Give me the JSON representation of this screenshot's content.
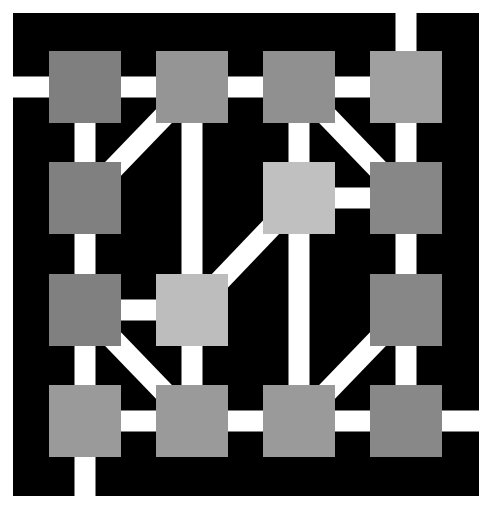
{
  "diagram": {
    "type": "grid-graph",
    "canvas": {
      "width": 490,
      "height": 509,
      "background": "#ffffff"
    },
    "board": {
      "x": 13,
      "y": 13,
      "width": 466,
      "height": 483,
      "color": "#000000"
    },
    "edge_color": "#ffffff",
    "edge_width": 21,
    "node_size": 72,
    "columns_x": [
      85,
      192,
      299,
      406
    ],
    "rows_y": [
      87,
      198,
      310,
      421
    ],
    "nodes": [
      {
        "id": "r0c0",
        "row": 0,
        "col": 0,
        "color": "#7f7f7f"
      },
      {
        "id": "r0c1",
        "row": 0,
        "col": 1,
        "color": "#959595"
      },
      {
        "id": "r0c2",
        "row": 0,
        "col": 2,
        "color": "#909090"
      },
      {
        "id": "r0c3",
        "row": 0,
        "col": 3,
        "color": "#a0a0a0"
      },
      {
        "id": "r1c0",
        "row": 1,
        "col": 0,
        "color": "#808080"
      },
      {
        "id": "r1c2",
        "row": 1,
        "col": 2,
        "color": "#c0c0c0"
      },
      {
        "id": "r1c3",
        "row": 1,
        "col": 3,
        "color": "#878787"
      },
      {
        "id": "r2c0",
        "row": 2,
        "col": 0,
        "color": "#808080"
      },
      {
        "id": "r2c1",
        "row": 2,
        "col": 1,
        "color": "#bdbdbd"
      },
      {
        "id": "r2c3",
        "row": 2,
        "col": 3,
        "color": "#878787"
      },
      {
        "id": "r3c0",
        "row": 3,
        "col": 0,
        "color": "#9a9a9a"
      },
      {
        "id": "r3c1",
        "row": 3,
        "col": 1,
        "color": "#9a9a9a"
      },
      {
        "id": "r3c2",
        "row": 3,
        "col": 2,
        "color": "#9a9a9a"
      },
      {
        "id": "r3c3",
        "row": 3,
        "col": 3,
        "color": "#888888"
      }
    ],
    "edges": [
      {
        "from": "r0c0",
        "to": "r0c1",
        "kind": "horizontal"
      },
      {
        "from": "r0c1",
        "to": "r0c2",
        "kind": "horizontal"
      },
      {
        "from": "r0c2",
        "to": "r0c3",
        "kind": "horizontal"
      },
      {
        "from": "r1c2",
        "to": "r1c3",
        "kind": "horizontal"
      },
      {
        "from": "r2c0",
        "to": "r2c1",
        "kind": "horizontal"
      },
      {
        "from": "r3c0",
        "to": "r3c1",
        "kind": "horizontal"
      },
      {
        "from": "r3c1",
        "to": "r3c2",
        "kind": "horizontal"
      },
      {
        "from": "r3c2",
        "to": "r3c3",
        "kind": "horizontal"
      },
      {
        "from": "r0c0",
        "to": "r3c0",
        "kind": "vertical"
      },
      {
        "from": "r0c1",
        "to": "r3c1",
        "kind": "vertical"
      },
      {
        "from": "r0c2",
        "to": "r3c2",
        "kind": "vertical"
      },
      {
        "from": "r0c3",
        "to": "r3c3",
        "kind": "vertical"
      },
      {
        "from": "r0c1",
        "to": "r1c0",
        "kind": "diagonal"
      },
      {
        "from": "r0c2",
        "to": "r1c3",
        "kind": "diagonal"
      },
      {
        "from": "r1c2",
        "to": "r2c1",
        "kind": "diagonal"
      },
      {
        "from": "r2c0",
        "to": "r3c1",
        "kind": "diagonal"
      },
      {
        "from": "r2c3",
        "to": "r3c2",
        "kind": "diagonal"
      }
    ],
    "exits": [
      {
        "node": "r0c0",
        "direction": "left"
      },
      {
        "node": "r0c3",
        "direction": "up"
      },
      {
        "node": "r3c0",
        "direction": "down"
      },
      {
        "node": "r3c3",
        "direction": "right"
      }
    ]
  }
}
